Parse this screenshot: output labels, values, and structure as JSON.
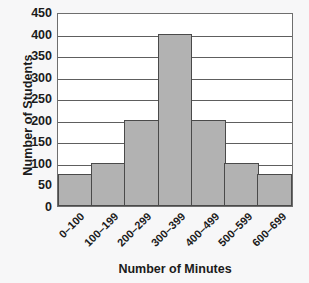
{
  "chart_data": {
    "type": "bar",
    "title": "",
    "subtitle": "",
    "xlabel": "Number of Minutes",
    "ylabel": "Number of Students",
    "categories": [
      "0–100",
      "100–199",
      "200–299",
      "300–399",
      "400–499",
      "500–599",
      "600–699"
    ],
    "values": [
      75,
      100,
      200,
      400,
      200,
      100,
      75
    ],
    "ylim": [
      0,
      450
    ],
    "ytick_values": [
      0,
      50,
      100,
      150,
      200,
      250,
      300,
      350,
      400,
      450
    ],
    "ytick_labels": [
      "0",
      "50",
      "100",
      "150",
      "200",
      "250",
      "300",
      "350",
      "400",
      "450"
    ],
    "grid": true,
    "grid_axis": "y",
    "legend": false,
    "legend_position": "none",
    "bar_gap": 0,
    "xtick_rotation": -45,
    "colors": {
      "bar_fill": "#b2b2b2",
      "bar_border": "#4a4a4a",
      "gridline": "#5e5e5e",
      "plot_border": "#6e6e6e",
      "plot_background": "#ffffff",
      "canvas_background": "#f7f7f8",
      "text": "#1b1b1b"
    }
  }
}
